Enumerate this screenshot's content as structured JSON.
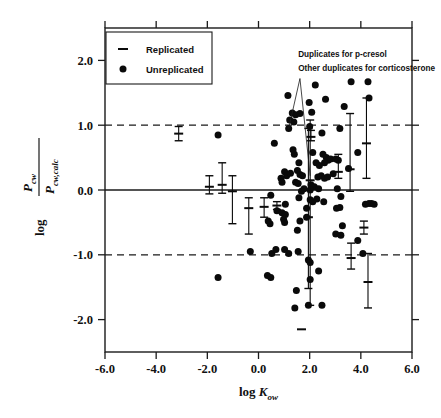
{
  "chart_data": {
    "type": "scatter",
    "title": "",
    "xlabel": "log K_ow",
    "xlabel_main": "log K",
    "xlabel_sub": "ow",
    "ylabel": "log (P_cw / P_cw,calc)",
    "ylabel_prefix": "log",
    "ylabel_numerator": "P",
    "ylabel_numerator_sub": "cw",
    "ylabel_denominator": "P",
    "ylabel_denominator_sub": "cw,calc",
    "xlim": [
      -6.0,
      6.0
    ],
    "ylim": [
      -2.5,
      2.5
    ],
    "xticks": [
      -6.0,
      -4.0,
      -2.0,
      0.0,
      2.0,
      4.0,
      6.0
    ],
    "xtick_labels": [
      "-6.0",
      "-4.0",
      "-2.0",
      "0.0",
      "2.0",
      "4.0",
      "6.0"
    ],
    "yticks": [
      2.0,
      1.0,
      0.0,
      -1.0,
      -2.0
    ],
    "ytick_labels": [
      "2.0",
      "1.0",
      "0.0",
      "-1.0",
      "-2.0"
    ],
    "grid": false,
    "reference_lines": [
      {
        "y": 1.0,
        "style": "dashed",
        "label": "+1 log unit"
      },
      {
        "y": 0.0,
        "style": "solid",
        "label": "zero"
      },
      {
        "y": -1.0,
        "style": "dashed",
        "label": "-1 log unit"
      }
    ],
    "legend_position": "top-left",
    "legend": [
      {
        "marker": "dash",
        "label": "Replicated"
      },
      {
        "marker": "dot",
        "label": "Unreplicated"
      }
    ],
    "annotations": [
      {
        "text": "Duplicates for p-cresol",
        "x": 1.55,
        "y": 2.05
      },
      {
        "text": "Other duplicates for corticosterone",
        "x": 1.55,
        "y": 1.83
      }
    ],
    "leader_lines": [
      {
        "from_x": 1.62,
        "from_y": 1.72,
        "to_x": 1.18,
        "to_y": 0.95
      },
      {
        "from_x": 1.62,
        "from_y": 1.72,
        "to_x": 2.02,
        "to_y": 0.22
      }
    ],
    "series": [
      {
        "name": "Unreplicated",
        "marker": "dot",
        "points": [
          [
            1.15,
            1.46
          ],
          [
            2.22,
            1.62
          ],
          [
            3.62,
            1.67
          ],
          [
            4.28,
            1.67
          ],
          [
            1.98,
            1.35
          ],
          [
            2.62,
            1.4
          ],
          [
            3.35,
            1.29
          ],
          [
            4.32,
            1.42
          ],
          [
            1.32,
            1.19
          ],
          [
            1.45,
            1.16
          ],
          [
            1.62,
            1.18
          ],
          [
            2.08,
            1.2
          ],
          [
            1.22,
            1.08
          ],
          [
            1.38,
            1.05
          ],
          [
            1.18,
            0.95
          ],
          [
            2.0,
            0.98
          ],
          [
            3.18,
            0.95
          ],
          [
            2.48,
            0.88
          ],
          [
            0.62,
            0.72
          ],
          [
            1.35,
            0.62
          ],
          [
            1.4,
            0.55
          ],
          [
            2.12,
            0.58
          ],
          [
            2.52,
            0.55
          ],
          [
            2.65,
            0.5
          ],
          [
            2.72,
            0.46
          ],
          [
            2.82,
            0.48
          ],
          [
            1.58,
            0.42
          ],
          [
            2.58,
            0.42
          ],
          [
            3.02,
            0.48
          ],
          [
            3.12,
            0.46
          ],
          [
            3.52,
            0.33
          ],
          [
            3.88,
            0.58
          ],
          [
            1.02,
            0.28
          ],
          [
            1.1,
            0.22
          ],
          [
            1.25,
            0.26
          ],
          [
            1.52,
            0.3
          ],
          [
            1.62,
            0.24
          ],
          [
            1.72,
            0.22
          ],
          [
            2.32,
            0.2
          ],
          [
            2.45,
            0.22
          ],
          [
            2.58,
            0.18
          ],
          [
            2.7,
            0.2
          ],
          [
            2.92,
            0.25
          ],
          [
            1.45,
            0.12
          ],
          [
            1.55,
            0.1
          ],
          [
            2.05,
            0.08
          ],
          [
            2.18,
            0.05
          ],
          [
            0.88,
            0.18
          ],
          [
            0.92,
            0.12
          ],
          [
            1.78,
            0.02
          ],
          [
            2.02,
            0.0
          ],
          [
            2.35,
            0.02
          ],
          [
            3.08,
            0.02
          ],
          [
            0.48,
            -0.08
          ],
          [
            1.58,
            -0.12
          ],
          [
            2.02,
            -0.15
          ],
          [
            2.12,
            -0.18
          ],
          [
            2.28,
            -0.14
          ],
          [
            3.22,
            -0.1
          ],
          [
            1.05,
            -0.22
          ],
          [
            0.72,
            -0.32
          ],
          [
            0.92,
            -0.35
          ],
          [
            1.05,
            -0.38
          ],
          [
            1.88,
            -0.28
          ],
          [
            2.55,
            -0.18
          ],
          [
            3.05,
            -0.28
          ],
          [
            3.18,
            -0.27
          ],
          [
            4.18,
            -0.22
          ],
          [
            4.32,
            -0.21
          ],
          [
            4.42,
            -0.21
          ],
          [
            4.52,
            -0.22
          ],
          [
            0.38,
            -0.48
          ],
          [
            0.45,
            -0.52
          ],
          [
            0.98,
            -0.45
          ],
          [
            1.02,
            -0.5
          ],
          [
            1.62,
            -0.48
          ],
          [
            1.88,
            -0.42
          ],
          [
            3.28,
            -0.55
          ],
          [
            3.88,
            -0.78
          ],
          [
            1.52,
            -0.62
          ],
          [
            3.02,
            -0.68
          ],
          [
            3.22,
            -0.7
          ],
          [
            -0.32,
            -0.95
          ],
          [
            0.52,
            -0.98
          ],
          [
            0.68,
            -0.92
          ],
          [
            1.02,
            -0.92
          ],
          [
            1.18,
            -0.98
          ],
          [
            1.55,
            -0.95
          ],
          [
            1.95,
            -1.08
          ],
          [
            2.02,
            -1.12
          ],
          [
            4.08,
            -0.98
          ],
          [
            0.35,
            -1.32
          ],
          [
            0.48,
            -1.35
          ],
          [
            -1.58,
            -1.35
          ],
          [
            2.35,
            -1.25
          ],
          [
            1.48,
            -1.55
          ],
          [
            2.02,
            -1.38
          ],
          [
            1.42,
            -1.82
          ],
          [
            1.95,
            -1.78
          ],
          [
            2.48,
            -1.78
          ],
          [
            -1.58,
            0.85
          ],
          [
            2.25,
            0.42
          ],
          [
            2.38,
            0.38
          ],
          [
            1.68,
            -0.02
          ]
        ]
      },
      {
        "name": "Replicated",
        "marker": "errorbar",
        "points": [
          {
            "x": -3.12,
            "y": 0.87,
            "ylow": 0.76,
            "yhigh": 0.98
          },
          {
            "x": -1.92,
            "y": 0.05,
            "ylow": -0.06,
            "yhigh": 0.22
          },
          {
            "x": -1.42,
            "y": 0.08,
            "ylow": -0.05,
            "yhigh": 0.42
          },
          {
            "x": -1.02,
            "y": -0.02,
            "ylow": -0.52,
            "yhigh": 0.22
          },
          {
            "x": -0.38,
            "y": -0.28,
            "ylow": -0.68,
            "yhigh": -0.12
          },
          {
            "x": 0.22,
            "y": -0.26,
            "ylow": -0.42,
            "yhigh": -0.12
          },
          {
            "x": 0.72,
            "y": -0.24,
            "ylow": -0.3,
            "yhigh": -0.18
          },
          {
            "x": 2.05,
            "y": 0.82,
            "ylow": 0.76,
            "yhigh": 0.92
          },
          {
            "x": 1.95,
            "y": -0.42,
            "ylow": -1.52,
            "yhigh": 0.95
          },
          {
            "x": 2.02,
            "y": 0.15,
            "ylow": -1.78,
            "yhigh": 1.08
          },
          {
            "x": 3.12,
            "y": 0.28,
            "ylow": 0.18,
            "yhigh": 0.55
          },
          {
            "x": 3.58,
            "y": 0.32,
            "ylow": -0.02,
            "yhigh": 1.18
          },
          {
            "x": 3.62,
            "y": -1.05,
            "ylow": -1.22,
            "yhigh": -0.82
          },
          {
            "x": 4.12,
            "y": -0.58,
            "ylow": -0.68,
            "yhigh": -0.48
          },
          {
            "x": 4.22,
            "y": 0.72,
            "ylow": 0.18,
            "yhigh": 1.42
          },
          {
            "x": 4.28,
            "y": -1.42,
            "ylow": -1.82,
            "yhigh": -0.98
          },
          {
            "x": 1.68,
            "y": -2.15,
            "ylow": -2.15,
            "yhigh": -2.15
          }
        ]
      }
    ]
  },
  "style": {
    "axis_color": "#1a1a1a",
    "marker_color": "#0a0a0a",
    "reference_line_color": "#1a1a1a",
    "background": "#ffffff"
  }
}
